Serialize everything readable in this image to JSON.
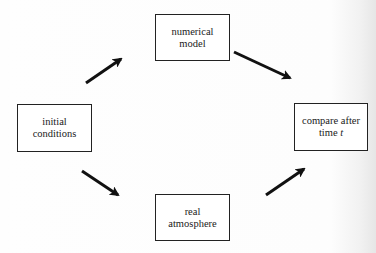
{
  "diagram": {
    "nodes": [
      {
        "id": "initial",
        "line1": "initial",
        "line2": "conditions"
      },
      {
        "id": "model",
        "line1": "numerical",
        "line2": "model"
      },
      {
        "id": "real",
        "line1": "real",
        "line2": "atmosphere"
      },
      {
        "id": "compare",
        "line1": "compare after",
        "line2_prefix": "time ",
        "line2_var": "t"
      }
    ],
    "edges": [
      {
        "from": "initial",
        "to": "model"
      },
      {
        "from": "model",
        "to": "compare"
      },
      {
        "from": "initial",
        "to": "real"
      },
      {
        "from": "real",
        "to": "compare"
      }
    ],
    "colors": {
      "stroke": "#111111",
      "box_border": "#222222",
      "background": "#fefefe"
    }
  }
}
